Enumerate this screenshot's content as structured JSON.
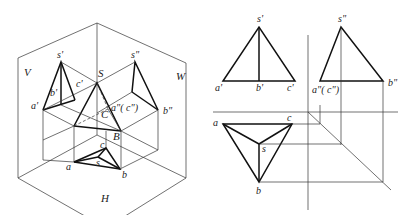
{
  "figure": {
    "left_view": {
      "title": "Axonometric projection of triangular pyramid in three projection planes",
      "plane_labels": {
        "V": "V",
        "W": "W",
        "H": "H"
      },
      "space_points": {
        "S": "S",
        "B": "B",
        "C": "C"
      },
      "v_projection_labels": {
        "s": "s'",
        "a": "a'",
        "b": "b'",
        "c": "c'"
      },
      "w_projection_labels": {
        "s": "s\"",
        "ac": "a\"( c\")",
        "b": "b\""
      },
      "h_projection_labels": {
        "a": "a",
        "b": "b",
        "c": "c",
        "s": "s"
      }
    },
    "right_view": {
      "title": "Three-view orthographic projection of triangular pyramid",
      "front_view_labels": {
        "s": "s'",
        "a": "a'",
        "b": "b'",
        "c": "c'"
      },
      "side_view_labels": {
        "s": "s\"",
        "ac": "a\"( c\")",
        "b": "b\""
      },
      "top_view_labels": {
        "a": "a",
        "b": "b",
        "c": "c",
        "s": "s"
      }
    }
  }
}
